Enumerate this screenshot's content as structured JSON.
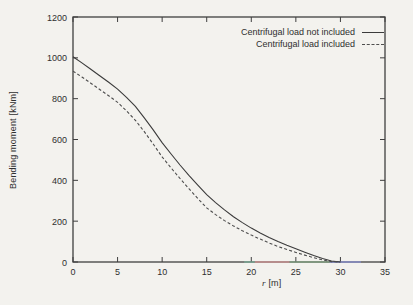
{
  "figure": {
    "width": 413,
    "height": 305,
    "background": "#f3f2ee",
    "axis_color": "#3f3f3f",
    "text_color": "#2f2f2f"
  },
  "chart_data": {
    "type": "line",
    "title": "",
    "xlabel_var": "r",
    "xlabel_unit": "[m]",
    "ylabel": "Bending moment [kNm]",
    "xlim": [
      0,
      35
    ],
    "ylim": [
      0,
      1200
    ],
    "xticks": [
      0,
      5,
      10,
      15,
      20,
      25,
      30,
      35
    ],
    "yticks": [
      0,
      200,
      400,
      600,
      800,
      1000,
      1200
    ],
    "grid": false,
    "legend_position": "top-right-inside",
    "series": [
      {
        "name": "Centrifugal load not included",
        "style": "solid",
        "color": "#3b3b3b",
        "x": [
          0,
          1,
          2,
          3,
          4,
          5,
          6,
          7,
          8,
          9,
          10,
          11,
          12,
          13,
          14,
          15,
          16,
          17,
          18,
          19,
          20,
          21,
          22,
          23,
          24,
          25,
          26,
          27,
          28,
          29,
          30
        ],
        "values": [
          1005,
          975,
          944,
          912,
          880,
          847,
          806,
          762,
          706,
          647,
          585,
          529,
          475,
          424,
          376,
          330,
          291,
          255,
          222,
          193,
          166,
          142,
          120,
          100,
          82,
          65,
          48,
          32,
          17,
          5,
          0
        ]
      },
      {
        "name": "Centrifugal load included",
        "style": "dashed",
        "color": "#4d4d4d",
        "x": [
          0,
          1,
          2,
          3,
          4,
          5,
          6,
          7,
          8,
          9,
          10,
          11,
          12,
          13,
          14,
          15,
          16,
          17,
          18,
          19,
          20,
          21,
          22,
          23,
          24,
          25,
          26,
          27,
          28,
          29,
          30
        ],
        "values": [
          935,
          906,
          876,
          845,
          814,
          782,
          740,
          694,
          638,
          578,
          515,
          461,
          409,
          359,
          311,
          265,
          232,
          203,
          177,
          153,
          132,
          112,
          93,
          76,
          61,
          47,
          34,
          21,
          10,
          2,
          0
        ]
      }
    ],
    "scan_artifacts": {
      "axis_tint_segments": [
        {
          "x_start": 19.2,
          "x_end": 20.4,
          "color": "#79b39c"
        },
        {
          "x_start": 20.4,
          "x_end": 24.3,
          "color": "#e39a9a"
        },
        {
          "x_start": 24.3,
          "x_end": 28.8,
          "color": "#84ad84"
        },
        {
          "x_start": 28.8,
          "x_end": 32.3,
          "color": "#8b93dd"
        }
      ]
    }
  }
}
